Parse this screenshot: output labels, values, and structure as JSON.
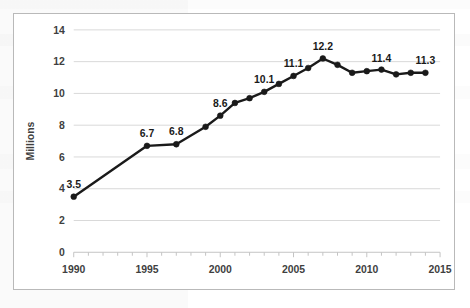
{
  "figure": {
    "name": "line-chart-figure",
    "border_color": "#b9b9b9",
    "background_color": "#ffffff"
  },
  "chart_data": {
    "type": "line",
    "title": "",
    "subtitle": "",
    "xlabel": "",
    "ylabel": "Millions",
    "xlim": [
      1990,
      2015
    ],
    "ylim": [
      0,
      14
    ],
    "grid": true,
    "legend": false,
    "legend_position": "none",
    "series_color": "#1a1a1a",
    "marker": "circle",
    "x_major_ticks": [
      1990,
      1995,
      2000,
      2005,
      2010,
      2015
    ],
    "x_tick_labels": [
      "1990",
      "1995",
      "2000",
      "2005",
      "2010",
      "2015"
    ],
    "x_minor_tick_interval": 1,
    "y_ticks": [
      0,
      2,
      4,
      6,
      8,
      10,
      12,
      14
    ],
    "y_tick_labels": [
      "0",
      "2",
      "4",
      "6",
      "8",
      "10",
      "12",
      "14"
    ],
    "x": [
      1990,
      1995,
      1997,
      1999,
      2000,
      2001,
      2002,
      2003,
      2004,
      2005,
      2006,
      2007,
      2008,
      2009,
      2010,
      2011,
      2012,
      2013,
      2014
    ],
    "values": [
      3.5,
      6.7,
      6.8,
      7.9,
      8.6,
      9.4,
      9.7,
      10.1,
      10.6,
      11.1,
      11.6,
      12.2,
      11.8,
      11.3,
      11.4,
      11.5,
      11.2,
      11.3,
      11.3
    ],
    "point_labels": [
      {
        "x": 1990,
        "y": 3.5,
        "text": "3.5"
      },
      {
        "x": 1995,
        "y": 6.7,
        "text": "6.7"
      },
      {
        "x": 1997,
        "y": 6.8,
        "text": "6.8"
      },
      {
        "x": 2000,
        "y": 8.6,
        "text": "8.6"
      },
      {
        "x": 2003,
        "y": 10.1,
        "text": "10.1"
      },
      {
        "x": 2005,
        "y": 11.1,
        "text": "11.1"
      },
      {
        "x": 2007,
        "y": 12.2,
        "text": "12.2"
      },
      {
        "x": 2011,
        "y": 11.4,
        "text": "11.4"
      },
      {
        "x": 2014,
        "y": 11.3,
        "text": "11.3"
      }
    ]
  }
}
